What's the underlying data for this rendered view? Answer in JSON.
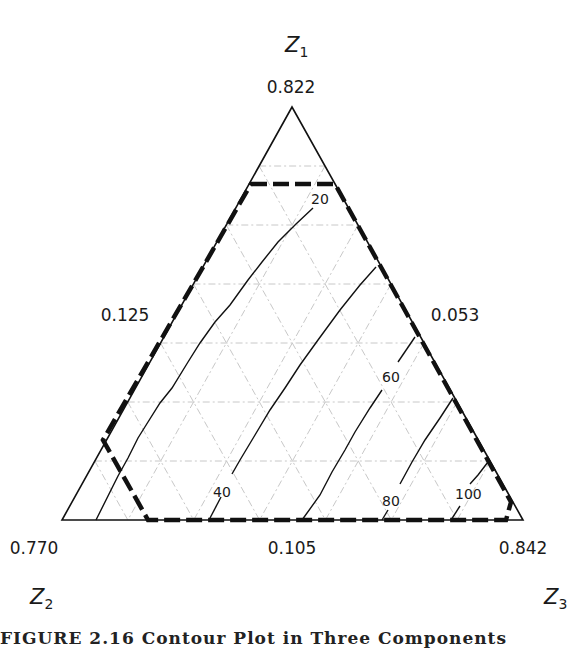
{
  "chart_data": {
    "type": "ternary-contour",
    "title": "",
    "vertices": {
      "top": {
        "name": "Z",
        "sub": "1",
        "value_label": "0.822"
      },
      "bottom_left": {
        "name": "Z",
        "sub": "2",
        "value_label": "0.770"
      },
      "bottom_right": {
        "name": "Z",
        "sub": "3",
        "value_label": "0.842"
      }
    },
    "edge_labels": {
      "left": "0.125",
      "right": "0.053",
      "bottom": "0.105"
    },
    "grid": {
      "on": true,
      "divisions": 7,
      "style": "dashed light gray"
    },
    "contours": [
      {
        "level": 20,
        "label": "20"
      },
      {
        "level": 40,
        "label": "40"
      },
      {
        "level": 60,
        "label": "60"
      },
      {
        "level": 80,
        "label": "80"
      },
      {
        "level": 100,
        "label": "100"
      }
    ],
    "constraint_region": {
      "style": "thick dashed black polygon",
      "description": "feasible region bounded by component constraints"
    }
  },
  "caption": "FIGURE 2.16  Contour Plot in Three Components"
}
